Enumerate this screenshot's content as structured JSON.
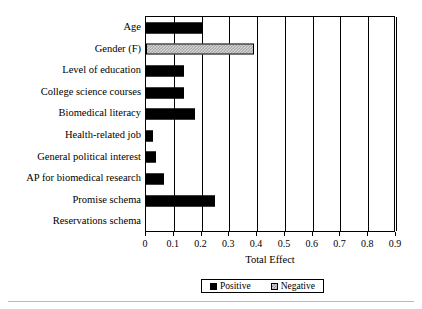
{
  "chart_data": {
    "type": "bar",
    "orientation": "horizontal",
    "title": "",
    "xlabel": "Total Effect",
    "ylabel": "",
    "xlim": [
      0,
      0.9
    ],
    "xticks": [
      "0",
      "0.1",
      "0.2",
      "0.3",
      "0.4",
      "0.5",
      "0.6",
      "0.7",
      "0.8",
      "0.9"
    ],
    "xtick_values": [
      0,
      0.1,
      0.2,
      0.3,
      0.4,
      0.5,
      0.6,
      0.7,
      0.8,
      0.9
    ],
    "grid": "vertical",
    "legend_position": "bottom",
    "categories": [
      "Age",
      "Gender (F)",
      "Level of education",
      "College science courses",
      "Biomedical literacy",
      "Health-related job",
      "General political interest",
      "AP for biomedical research",
      "Promise schema",
      "Reservations schema"
    ],
    "values": [
      0.205,
      0.39,
      0.135,
      0.135,
      0.175,
      0.025,
      0.035,
      0.065,
      0.25,
      0
    ],
    "effect_signs": [
      "Positive",
      "Negative",
      "Positive",
      "Positive",
      "Positive",
      "Positive",
      "Positive",
      "Positive",
      "Positive",
      "Positive"
    ],
    "legend": [
      {
        "label": "Positive",
        "swatch": "solid-black"
      },
      {
        "label": "Negative",
        "swatch": "hatched-gray"
      }
    ],
    "colors": {
      "positive": "#000000",
      "negative": "#d6d6d6",
      "axis": "#000000",
      "background": "#ffffff"
    }
  }
}
